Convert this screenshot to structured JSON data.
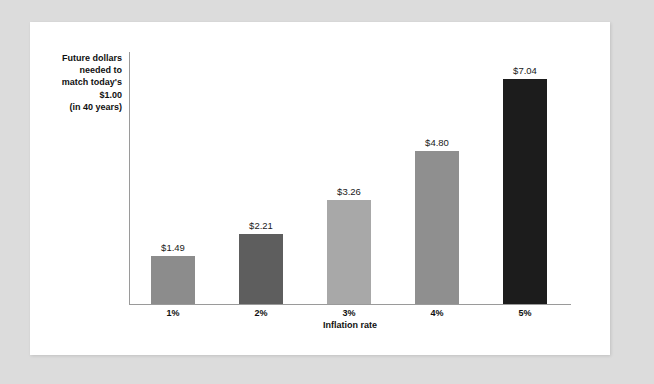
{
  "chart_data": {
    "type": "bar",
    "title": "",
    "xlabel": "Inflation rate",
    "ylabel": "Future dollars needed to match today's $1.00 (in 40 years)",
    "ylabel_lines": [
      "Future dollars",
      "needed to",
      "match today's",
      "$1.00",
      "(in 40 years)"
    ],
    "categories": [
      "1%",
      "2%",
      "3%",
      "4%",
      "5%"
    ],
    "values": [
      1.49,
      2.21,
      3.26,
      4.8,
      7.04
    ],
    "value_labels": [
      "$1.49",
      "$2.21",
      "$3.26",
      "$4.80",
      "$7.04"
    ],
    "bar_colors": [
      "#8c8c8c",
      "#5e5e5e",
      "#a8a8a8",
      "#8f8f8f",
      "#1c1c1c"
    ],
    "ylim": [
      0,
      7.9
    ],
    "grid": false,
    "legend": null,
    "axis_color": "#9a9a9a",
    "background": "#ffffff",
    "page_background": "#dcdcdc"
  }
}
